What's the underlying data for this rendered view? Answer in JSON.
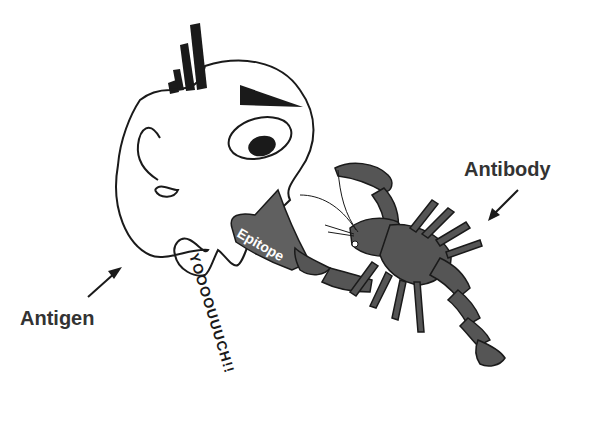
{
  "labels": {
    "antigen": "Antigen",
    "antibody": "Antibody",
    "epitope": "Epitope",
    "scream": "YOOOOUUUCH!!"
  },
  "colors": {
    "line": "#1a1a1a",
    "fill_dark": "#555555",
    "text": "#333333",
    "background": "#ffffff"
  }
}
